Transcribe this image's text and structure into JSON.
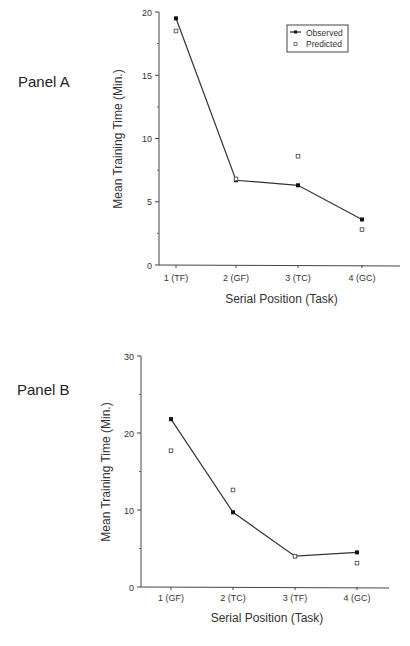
{
  "chart_data": [
    {
      "type": "line",
      "panel": "Panel A",
      "title": "",
      "xlabel": "Serial Position (Task)",
      "ylabel": "Mean Training Time (Min.)",
      "categories": [
        "1 (TF)",
        "2 (GF)",
        "3 (TC)",
        "4 (GC)"
      ],
      "series": [
        {
          "name": "Observed",
          "style": "line+filled-square",
          "values": [
            19.5,
            6.7,
            6.3,
            3.6
          ]
        },
        {
          "name": "Predicted",
          "style": "open-square",
          "values": [
            18.5,
            6.8,
            8.6,
            2.8
          ]
        }
      ],
      "ylim": [
        0,
        20
      ],
      "yticks": [
        0,
        5,
        10,
        15,
        20
      ],
      "legend": {
        "position": "top-right",
        "entries": [
          "Observed",
          "Predicted"
        ]
      },
      "grid": false
    },
    {
      "type": "line",
      "panel": "Panel B",
      "title": "",
      "xlabel": "Serial Position (Task)",
      "ylabel": "Mean Training Time (Min.)",
      "categories": [
        "1 (GF)",
        "2 (TC)",
        "3 (TF)",
        "4 (GC)"
      ],
      "series": [
        {
          "name": "Observed",
          "style": "line+filled-square",
          "values": [
            21.8,
            9.7,
            4.0,
            4.5
          ]
        },
        {
          "name": "Predicted",
          "style": "open-square",
          "values": [
            17.7,
            12.6,
            4.0,
            3.1
          ]
        }
      ],
      "ylim": [
        0,
        30
      ],
      "yticks": [
        0,
        10,
        20,
        30
      ],
      "grid": false
    }
  ],
  "labels": {
    "panel_a": "Panel A",
    "panel_b": "Panel B",
    "legend_observed": "Observed",
    "legend_predicted": "Predicted"
  }
}
